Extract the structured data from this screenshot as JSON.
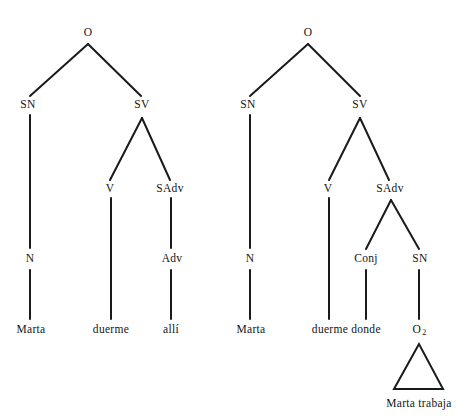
{
  "figure": {
    "kind": "syntax-tree-pair",
    "background_color": "#ffffff",
    "line_color": "#1a1a1a",
    "text_color": "#141414"
  },
  "trees": [
    {
      "id": "left-tree",
      "sentence": "Marta duerme allí",
      "nodes": [
        {
          "id": "l-o",
          "label": "O",
          "x": 88,
          "y": 33
        },
        {
          "id": "l-sn",
          "label": "SN",
          "x": 28,
          "y": 105
        },
        {
          "id": "l-sv",
          "label": "SV",
          "x": 142,
          "y": 105
        },
        {
          "id": "l-v",
          "label": "V",
          "x": 110,
          "y": 189
        },
        {
          "id": "l-sadv",
          "label": "SAdv",
          "x": 170,
          "y": 189
        },
        {
          "id": "l-n",
          "label": "N",
          "x": 30,
          "y": 259
        },
        {
          "id": "l-adv",
          "label": "Adv",
          "x": 172,
          "y": 259
        },
        {
          "id": "l-marta",
          "label": "Marta",
          "x": 31,
          "y": 330
        },
        {
          "id": "l-duerme",
          "label": "duerme",
          "x": 111,
          "y": 330
        },
        {
          "id": "l-alli",
          "label": "allí",
          "x": 171,
          "y": 330
        }
      ]
    },
    {
      "id": "right-tree",
      "sentence": "Marta duerme donde Marta trabaja",
      "nodes": [
        {
          "id": "r-o",
          "label": "O",
          "x": 308,
          "y": 33
        },
        {
          "id": "r-sn",
          "label": "SN",
          "x": 248,
          "y": 105
        },
        {
          "id": "r-sv",
          "label": "SV",
          "x": 360,
          "y": 105
        },
        {
          "id": "r-v",
          "label": "V",
          "x": 328,
          "y": 189
        },
        {
          "id": "r-sadv",
          "label": "SAdv",
          "x": 390,
          "y": 189
        },
        {
          "id": "r-n",
          "label": "N",
          "x": 250,
          "y": 259
        },
        {
          "id": "r-conj",
          "label": "Conj",
          "x": 366,
          "y": 259
        },
        {
          "id": "r-sn2",
          "label": "SN",
          "x": 420,
          "y": 259
        },
        {
          "id": "r-marta",
          "label": "Marta",
          "x": 251,
          "y": 330
        },
        {
          "id": "r-duerme",
          "label": "duerme",
          "x": 330,
          "y": 330
        },
        {
          "id": "r-donde",
          "label": "donde",
          "x": 366,
          "y": 330
        },
        {
          "id": "r-o2",
          "label": "O",
          "sub": "2",
          "x": 419,
          "y": 330
        },
        {
          "id": "r-trabaja",
          "label": "Marta trabaja",
          "x": 419,
          "y": 404
        }
      ],
      "triangle": {
        "apex_x": 419,
        "apex_y": 344,
        "left_x": 394,
        "right_x": 443,
        "base_y": 389
      }
    }
  ],
  "edges": [
    {
      "name": "l-o-to-sn",
      "x1": 88,
      "y1": 44,
      "x2": 30,
      "y2": 96
    },
    {
      "name": "l-o-to-sv",
      "x1": 88,
      "y1": 44,
      "x2": 141,
      "y2": 96
    },
    {
      "name": "l-sn-to-n",
      "x1": 30,
      "y1": 115,
      "x2": 30,
      "y2": 248
    },
    {
      "name": "l-sv-to-v",
      "x1": 142,
      "y1": 118,
      "x2": 110,
      "y2": 180
    },
    {
      "name": "l-sv-to-sadv",
      "x1": 142,
      "y1": 118,
      "x2": 170,
      "y2": 180
    },
    {
      "name": "l-v-to-duerme",
      "x1": 111,
      "y1": 198,
      "x2": 111,
      "y2": 319
    },
    {
      "name": "l-sadv-to-adv",
      "x1": 171,
      "y1": 198,
      "x2": 171,
      "y2": 248
    },
    {
      "name": "l-n-to-marta",
      "x1": 30,
      "y1": 270,
      "x2": 30,
      "y2": 319
    },
    {
      "name": "l-adv-to-alli",
      "x1": 171,
      "y1": 270,
      "x2": 171,
      "y2": 319
    },
    {
      "name": "r-o-to-sn",
      "x1": 308,
      "y1": 44,
      "x2": 250,
      "y2": 96
    },
    {
      "name": "r-o-to-sv",
      "x1": 308,
      "y1": 44,
      "x2": 360,
      "y2": 96
    },
    {
      "name": "r-sn-to-n",
      "x1": 250,
      "y1": 115,
      "x2": 250,
      "y2": 248
    },
    {
      "name": "r-sv-to-v",
      "x1": 360,
      "y1": 118,
      "x2": 329,
      "y2": 180
    },
    {
      "name": "r-sv-to-sadv",
      "x1": 360,
      "y1": 118,
      "x2": 389,
      "y2": 180
    },
    {
      "name": "r-v-to-duerme",
      "x1": 329,
      "y1": 198,
      "x2": 329,
      "y2": 319
    },
    {
      "name": "r-sadv-to-conj",
      "x1": 391,
      "y1": 200,
      "x2": 366,
      "y2": 249
    },
    {
      "name": "r-sadv-to-sn2",
      "x1": 391,
      "y1": 200,
      "x2": 419,
      "y2": 249
    },
    {
      "name": "r-n-to-marta",
      "x1": 250,
      "y1": 270,
      "x2": 250,
      "y2": 319
    },
    {
      "name": "r-conj-to-donde",
      "x1": 366,
      "y1": 270,
      "x2": 366,
      "y2": 319
    },
    {
      "name": "r-sn2-to-o2",
      "x1": 419,
      "y1": 270,
      "x2": 419,
      "y2": 319
    }
  ]
}
